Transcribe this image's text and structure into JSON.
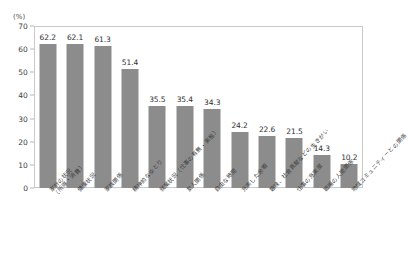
{
  "chart_data": {
    "type": "bar",
    "title": "",
    "subtitle": "",
    "xlabel": "",
    "ylabel": "(%)",
    "unit_label": "(%)",
    "ylim": [
      0,
      70
    ],
    "yticks": [
      0,
      10,
      20,
      30,
      40,
      50,
      60,
      70
    ],
    "ytick_labels": [
      "0",
      "10",
      "20",
      "30",
      "40",
      "50",
      "60",
      "70"
    ],
    "grid": false,
    "legend": false,
    "legend_position": "none",
    "bar_color": "#8c8c8c",
    "frame_color": "#c9c9c9",
    "categories": [
      "家計の状況（所得・消費）",
      "健康状況",
      "家族関係",
      "精神的なゆとり",
      "就業状況（仕事の有無・実態）",
      "友人関係",
      "自由な時間",
      "充実した余暇",
      "趣味、社会貢献などの生きがい",
      "仕事の充実度",
      "職場の人間関係",
      "地域コミュニティーとの関係"
    ],
    "category_lines": [
      [
        "家計の状況",
        "（所得・消費）"
      ],
      [
        "健康状況"
      ],
      [
        "家族関係"
      ],
      [
        "精神的なゆとり"
      ],
      [
        "就業状況（仕事の有無・実態）"
      ],
      [
        "友人関係"
      ],
      [
        "自由な時間"
      ],
      [
        "充実した余暇"
      ],
      [
        "趣味、社会貢献などの生きがい"
      ],
      [
        "仕事の充実度"
      ],
      [
        "職場の人間関係"
      ],
      [
        "地域コミュニティーとの関係"
      ]
    ],
    "values": [
      62.2,
      62.1,
      61.3,
      51.4,
      35.5,
      35.4,
      34.3,
      24.2,
      22.6,
      21.5,
      14.3,
      10.2
    ],
    "value_labels": [
      "62.2",
      "62.1",
      "61.3",
      "51.4",
      "35.5",
      "35.4",
      "34.3",
      "24.2",
      "22.6",
      "21.5",
      "14.3",
      "10.2"
    ]
  }
}
